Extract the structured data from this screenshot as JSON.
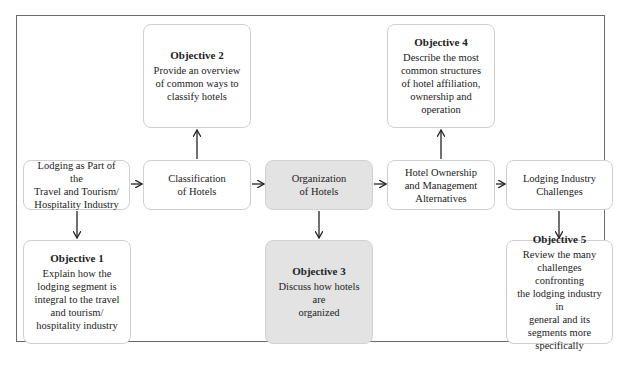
{
  "diagram": {
    "flow": [
      {
        "id": "n1",
        "label": "Lodging as Part of the\nTravel and Tourism/\nHospitality Industry",
        "highlighted": false
      },
      {
        "id": "n2",
        "label": "Classification\nof Hotels",
        "highlighted": false
      },
      {
        "id": "n3",
        "label": "Organization\nof Hotels",
        "highlighted": true
      },
      {
        "id": "n4",
        "label": "Hotel Ownership\nand Management\nAlternatives",
        "highlighted": false
      },
      {
        "id": "n5",
        "label": "Lodging Industry\nChallenges",
        "highlighted": false
      }
    ],
    "objectives": [
      {
        "id": "o1",
        "title": "Objective 1",
        "text": "Explain how the\nlodging segment is\nintegral to the travel\nand tourism/\nhospitality industry",
        "attached_to": "n1",
        "position": "below"
      },
      {
        "id": "o2",
        "title": "Objective 2",
        "text": "Provide an overview\nof common ways to\nclassify hotels",
        "attached_to": "n2",
        "position": "above"
      },
      {
        "id": "o3",
        "title": "Objective 3",
        "text": "Discuss how hotels are\norganized",
        "attached_to": "n3",
        "position": "below",
        "highlighted": true
      },
      {
        "id": "o4",
        "title": "Objective 4",
        "text": "Describe the most\ncommon structures\nof hotel affiliation,\nownership and\noperation",
        "attached_to": "n4",
        "position": "above"
      },
      {
        "id": "o5",
        "title": "Objective 5",
        "text": "Review the many\nchallenges confronting\nthe lodging industry in\ngeneral and its\nsegments more\nspecifically",
        "attached_to": "n5",
        "position": "below"
      }
    ],
    "colors": {
      "highlight": "#e3e3e3",
      "border": "#cfcfcf",
      "frame": "#6a6a6a",
      "arrow": "#222222"
    }
  }
}
